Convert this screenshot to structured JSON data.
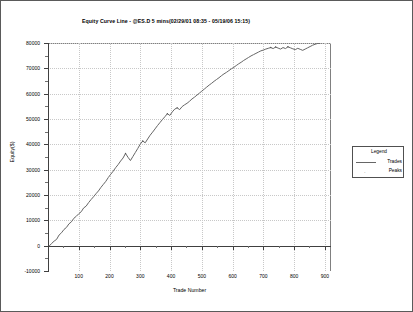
{
  "chart_data": {
    "type": "line",
    "title": "Equity Curve Line - @ES.D 5 mins(02/29/01 08:35 - 05/19/06 15:15)",
    "xlabel": "Trade Number",
    "ylabel": "Equity($)",
    "xlim": [
      0,
      920
    ],
    "ylim": [
      -10000,
      80000
    ],
    "grid": true,
    "legend": {
      "title": "Legend",
      "position": "right-outside",
      "entries": [
        {
          "label": "Trades",
          "marker": "line",
          "color": "#666666"
        },
        {
          "label": "Peaks",
          "marker": "point",
          "color": "#555555"
        }
      ]
    },
    "xticks": [
      100,
      200,
      300,
      400,
      500,
      600,
      700,
      800,
      900
    ],
    "yticks": [
      -10000,
      0,
      10000,
      20000,
      30000,
      40000,
      50000,
      60000,
      70000,
      80000
    ],
    "ytick_labels": [
      "-10000",
      "0",
      "10000",
      "20000",
      "30000",
      "40000",
      "50000",
      "60000",
      "70000",
      "80000"
    ],
    "xtick_labels": [
      "100",
      "200",
      "300",
      "400",
      "500",
      "600",
      "700",
      "800",
      "900"
    ],
    "series": [
      {
        "name": "Trades",
        "color": "#666666",
        "x": [
          5,
          12,
          20,
          28,
          36,
          44,
          52,
          60,
          68,
          76,
          84,
          92,
          100,
          108,
          116,
          124,
          132,
          140,
          148,
          156,
          164,
          172,
          180,
          188,
          196,
          204,
          212,
          220,
          228,
          236,
          244,
          252,
          260,
          268,
          276,
          284,
          292,
          300,
          308,
          316,
          324,
          332,
          340,
          348,
          356,
          364,
          372,
          380,
          388,
          396,
          404,
          412,
          420,
          428,
          436,
          444,
          452,
          460,
          468,
          476,
          484,
          492,
          500,
          508,
          516,
          524,
          532,
          540,
          548,
          556,
          564,
          572,
          580,
          588,
          596,
          604,
          612,
          620,
          628,
          636,
          644,
          652,
          660,
          668,
          676,
          684,
          692,
          700,
          708,
          716,
          724,
          732,
          740,
          748,
          756,
          764,
          772,
          780,
          788,
          796,
          804,
          812,
          820,
          828,
          836,
          844,
          852,
          860,
          868,
          876,
          884
        ],
        "values": [
          0,
          900,
          1800,
          2500,
          4200,
          5100,
          6400,
          7200,
          8600,
          9400,
          10800,
          11600,
          12600,
          13400,
          14900,
          15600,
          17000,
          18200,
          19300,
          20500,
          21600,
          23000,
          24200,
          25400,
          26900,
          28200,
          29400,
          30800,
          32000,
          33400,
          34600,
          36400,
          34900,
          33600,
          35200,
          36800,
          38400,
          40100,
          41300,
          40600,
          42100,
          43600,
          44800,
          46100,
          47400,
          48600,
          49800,
          50900,
          52100,
          51400,
          52800,
          53900,
          54400,
          53700,
          54900,
          55600,
          56200,
          57000,
          57900,
          58600,
          59400,
          60200,
          61000,
          61800,
          62600,
          63400,
          64100,
          64900,
          65600,
          66300,
          67100,
          67800,
          68400,
          69100,
          69800,
          70400,
          71100,
          71800,
          72400,
          73100,
          73700,
          74300,
          74900,
          75400,
          75900,
          76400,
          76900,
          77200,
          77600,
          77900,
          78200,
          77800,
          78400,
          78000,
          77600,
          78200,
          77800,
          78500,
          78100,
          77700,
          77400,
          77900,
          77500,
          77100,
          77600,
          78100,
          78600,
          79100,
          79500,
          79800,
          79900
        ]
      }
    ]
  }
}
